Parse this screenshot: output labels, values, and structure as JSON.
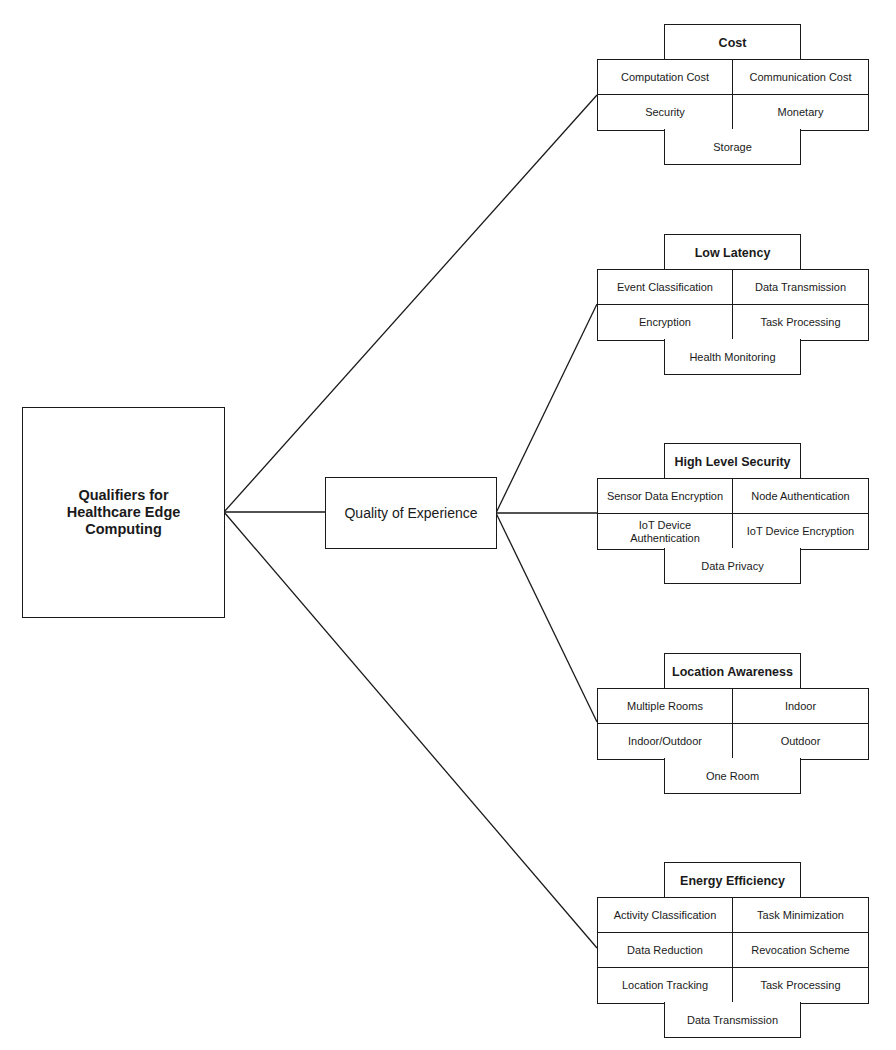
{
  "root": {
    "label": "Qualifiers for Healthcare Edge Computing"
  },
  "intermediate": {
    "label": "Quality of Experience"
  },
  "groups": {
    "cost": {
      "title": "Cost",
      "items": [
        "Computation Cost",
        "Communication Cost",
        "Security",
        "Monetary"
      ],
      "footer": "Storage"
    },
    "low_latency": {
      "title": "Low Latency",
      "items": [
        "Event Classification",
        "Data Transmission",
        "Encryption",
        "Task Processing"
      ],
      "footer": "Health Monitoring"
    },
    "high_level_security": {
      "title": "High Level Security",
      "items": [
        "Sensor Data Encryption",
        "Node Authentication",
        "IoT Device Authentication",
        "IoT Device Encryption"
      ],
      "footer": "Data Privacy"
    },
    "location_awareness": {
      "title": "Location Awareness",
      "items": [
        "Multiple Rooms",
        "Indoor",
        "Indoor/Outdoor",
        "Outdoor"
      ],
      "footer": "One Room"
    },
    "energy_efficiency": {
      "title": "Energy Efficiency",
      "items": [
        "Activity Classification",
        "Task Minimization",
        "Data Reduction",
        "Revocation Scheme",
        "Location Tracking",
        "Task Processing"
      ],
      "footer": "Data Transmission"
    }
  },
  "edges": [
    {
      "from": "root",
      "to": "cost"
    },
    {
      "from": "root",
      "to": "intermediate"
    },
    {
      "from": "root",
      "to": "energy_efficiency"
    },
    {
      "from": "intermediate",
      "to": "low_latency"
    },
    {
      "from": "intermediate",
      "to": "high_level_security"
    },
    {
      "from": "intermediate",
      "to": "location_awareness"
    }
  ],
  "colors": {
    "stroke": "#1a1a1a",
    "background": "#ffffff"
  }
}
